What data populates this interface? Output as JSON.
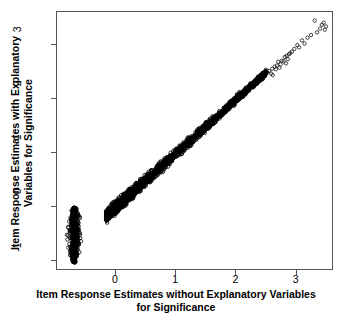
{
  "chart_data": {
    "type": "scatter",
    "title": "",
    "xlabel": "Item Response Estimates without Explanatory Variables for Significance",
    "xlabel_lines": [
      "Item Response Estimates without Explanatory Variables",
      "for Significance"
    ],
    "ylabel": "Item Response Estimates with Explanatory Variables for Significance",
    "ylabel_lines": [
      "Item Response Estimates with Explanatory",
      "Variables for Significance"
    ],
    "xlim": [
      -0.98,
      3.62
    ],
    "ylim": [
      -1.18,
      3.62
    ],
    "xticks": [
      0,
      1,
      2,
      3
    ],
    "xtick_labels": [
      "0",
      "1",
      "2",
      "3"
    ],
    "yticks": [
      -1,
      0,
      1,
      2,
      3
    ],
    "ytick_labels": [
      "-1",
      "0",
      "1",
      "2",
      "3"
    ],
    "grid": false,
    "legend": null,
    "marker": "open-circle",
    "marker_size_px": 3.4,
    "marker_color": "#000000",
    "series": [
      {
        "name": "Isolated low cluster",
        "n_points": 420,
        "x_range": [
          -0.84,
          -0.54
        ],
        "y_range": [
          -1.06,
          -0.03
        ],
        "description": "Dense near-vertical elongated cluster of item estimates at low x"
      },
      {
        "name": "Main diagonal band",
        "n_points": 2100,
        "x_range": [
          -0.16,
          2.52
        ],
        "y_range": [
          -0.36,
          2.48
        ],
        "slope": 1.0,
        "intercept": -0.03,
        "description": "Dense 1:1 diagonal band of overlapping open circles"
      },
      {
        "name": "Upper tail",
        "n_points": 34,
        "x_range": [
          2.55,
          3.52
        ],
        "y_range": [
          2.5,
          3.46
        ],
        "slope": 1.0,
        "intercept": -0.02,
        "description": "Sparse individually visible open circles continuing the diagonal"
      }
    ],
    "sparse_points": [
      [
        2.57,
        2.52
      ],
      [
        2.62,
        2.56
      ],
      [
        2.66,
        2.6
      ],
      [
        2.7,
        2.62
      ],
      [
        2.63,
        2.44
      ],
      [
        2.72,
        2.69
      ],
      [
        2.78,
        2.71
      ],
      [
        2.74,
        2.58
      ],
      [
        2.83,
        2.78
      ],
      [
        2.86,
        2.8
      ],
      [
        2.88,
        2.74
      ],
      [
        2.92,
        2.85
      ],
      [
        2.95,
        2.88
      ],
      [
        2.85,
        2.66
      ],
      [
        2.99,
        2.93
      ],
      [
        3.04,
        3.0
      ],
      [
        3.07,
        2.96
      ],
      [
        3.12,
        3.09
      ],
      [
        3.16,
        3.03
      ],
      [
        3.21,
        3.14
      ],
      [
        3.27,
        3.19
      ],
      [
        3.33,
        3.46
      ],
      [
        3.37,
        3.24
      ],
      [
        3.42,
        3.31
      ],
      [
        3.45,
        3.38
      ],
      [
        3.48,
        3.42
      ],
      [
        3.5,
        3.29
      ],
      [
        3.52,
        3.35
      ],
      [
        2.54,
        2.49
      ],
      [
        2.6,
        2.47
      ],
      [
        2.68,
        2.55
      ],
      [
        2.76,
        2.64
      ],
      [
        2.81,
        2.7
      ],
      [
        2.9,
        2.83
      ]
    ]
  }
}
